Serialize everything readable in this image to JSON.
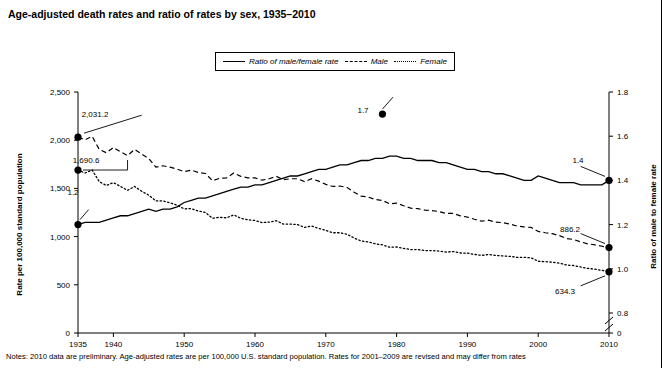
{
  "title": "Age-adjusted death rates and ratio of rates by sex, 1935–2010",
  "notes": "Notes: 2010 data are preliminary. Age-adjusted rates are per 100,000 U.S. standard population. Rates for 2001–2009 are revised and may differ from rates",
  "axis_left_label": "Rate per 100,000 standard population",
  "axis_right_label": "Ratio of male to female rate",
  "legend": {
    "items": [
      {
        "label": "Ratio of male/female rate",
        "style": "solid",
        "icon": "line-solid-icon"
      },
      {
        "label": "Male",
        "style": "dashed",
        "icon": "line-dashed-icon"
      },
      {
        "label": "Female",
        "style": "dotted",
        "icon": "line-dotted-icon"
      }
    ]
  },
  "annotations": [
    {
      "name": "male-start-label",
      "text": "2,031.2",
      "x": 95,
      "y": 117
    },
    {
      "name": "female-start-label",
      "text": "1,690.6",
      "x": 86,
      "y": 163
    },
    {
      "name": "ratio-start-label",
      "text": "1.2",
      "x": 73,
      "y": 195
    },
    {
      "name": "ratio-peak-label",
      "text": "1.7",
      "x": 363,
      "y": 113
    },
    {
      "name": "ratio-end-label",
      "text": "1.4",
      "x": 578,
      "y": 163
    },
    {
      "name": "male-end-label",
      "text": "886.2",
      "x": 570,
      "y": 232
    },
    {
      "name": "female-end-label",
      "text": "634.3",
      "x": 565,
      "y": 294
    }
  ],
  "chart_data": {
    "type": "line",
    "title": "Age-adjusted death rates and ratio of rates by sex, 1935–2010",
    "xlabel": "",
    "ylabel": "Rate per 100,000 standard population",
    "y2label": "Ratio of male to female rate",
    "grid": false,
    "legend_position": "top-center",
    "xlim": [
      1935,
      2010
    ],
    "ylim": [
      0,
      2500
    ],
    "y2lim": [
      0.8,
      1.8
    ],
    "y2_axis_break": true,
    "yticks": [
      0,
      500,
      1000,
      1500,
      2000,
      2500
    ],
    "ytick_labels": [
      "0",
      "500",
      "1,000",
      "1,500",
      "2,000",
      "2,500"
    ],
    "y2ticks": [
      0,
      0.8,
      1.0,
      1.2,
      1.4,
      1.6,
      1.8
    ],
    "y2tick_labels": [
      "0",
      "0.8",
      "1.0",
      "1.2",
      "1.4",
      "1.6",
      "1.8"
    ],
    "xticks": [
      1935,
      1940,
      1950,
      1960,
      1970,
      1980,
      1990,
      2000,
      2010
    ],
    "xtick_labels": [
      "1935",
      "1940",
      "1950",
      "1960",
      "1970",
      "1980",
      "1990",
      "2000",
      "2010"
    ],
    "annotated_points": [
      {
        "series": "Male",
        "x": 1935,
        "y": 2031.2,
        "label": "2,031.2"
      },
      {
        "series": "Female",
        "x": 1935,
        "y": 1690.6,
        "label": "1,690.6"
      },
      {
        "series": "Ratio of male/female rate",
        "x": 1935,
        "y": 1.2,
        "label": "1.2"
      },
      {
        "series": "Ratio of male/female rate",
        "x": 1978,
        "y": 1.7,
        "label": "1.7"
      },
      {
        "series": "Ratio of male/female rate",
        "x": 2010,
        "y": 1.4,
        "label": "1.4"
      },
      {
        "series": "Male",
        "x": 2010,
        "y": 886.2,
        "label": "886.2"
      },
      {
        "series": "Female",
        "x": 2010,
        "y": 634.3,
        "label": "634.3"
      }
    ],
    "x": [
      1935,
      1936,
      1937,
      1938,
      1939,
      1940,
      1941,
      1942,
      1943,
      1944,
      1945,
      1946,
      1947,
      1948,
      1949,
      1950,
      1951,
      1952,
      1953,
      1954,
      1955,
      1956,
      1957,
      1958,
      1959,
      1960,
      1961,
      1962,
      1963,
      1964,
      1965,
      1966,
      1967,
      1968,
      1969,
      1970,
      1971,
      1972,
      1973,
      1974,
      1975,
      1976,
      1977,
      1978,
      1979,
      1980,
      1981,
      1982,
      1983,
      1984,
      1985,
      1986,
      1987,
      1988,
      1989,
      1990,
      1991,
      1992,
      1993,
      1994,
      1995,
      1996,
      1997,
      1998,
      1999,
      2000,
      2001,
      2002,
      2003,
      2004,
      2005,
      2006,
      2007,
      2008,
      2009,
      2010
    ],
    "series": [
      {
        "name": "Male",
        "axis": "left",
        "style": "dashed",
        "values": [
          2031.2,
          2005.0,
          2040.0,
          1905.0,
          1870.0,
          1925.0,
          1880.0,
          1840.0,
          1905.0,
          1855.0,
          1810.0,
          1720.0,
          1735.0,
          1720.0,
          1700.0,
          1674.0,
          1690.0,
          1665.0,
          1655.0,
          1580.0,
          1605.0,
          1610.0,
          1660.0,
          1625.0,
          1610.0,
          1609.0,
          1585.0,
          1600.0,
          1625.0,
          1590.0,
          1600.0,
          1600.0,
          1570.0,
          1600.0,
          1575.0,
          1542.1,
          1520.0,
          1525.0,
          1510.0,
          1460.0,
          1420.0,
          1410.0,
          1385.0,
          1375.0,
          1340.0,
          1348.1,
          1320.0,
          1295.0,
          1290.0,
          1275.0,
          1270.0,
          1260.0,
          1240.0,
          1240.0,
          1215.0,
          1202.8,
          1180.0,
          1160.0,
          1170.0,
          1150.0,
          1145.0,
          1130.0,
          1110.0,
          1100.0,
          1095.0,
          1053.8,
          1040.0,
          1030.0,
          1010.0,
          980.0,
          970.0,
          945.0,
          925.0,
          915.0,
          900.0,
          886.2
        ]
      },
      {
        "name": "Female",
        "axis": "left",
        "style": "dotted",
        "values": [
          1690.6,
          1660.0,
          1690.0,
          1570.0,
          1530.0,
          1560.0,
          1520.0,
          1480.0,
          1520.0,
          1470.0,
          1430.0,
          1370.0,
          1370.0,
          1350.0,
          1325.0,
          1288.0,
          1290.0,
          1265.0,
          1250.0,
          1190.0,
          1200.0,
          1195.0,
          1225.0,
          1190.0,
          1175.0,
          1167.0,
          1145.0,
          1150.0,
          1165.0,
          1130.0,
          1130.0,
          1125.0,
          1095.0,
          1110.0,
          1085.0,
          1064.0,
          1040.0,
          1040.0,
          1025.0,
          985.0,
          955.0,
          945.0,
          925.0,
          915.0,
          890.0,
          892.5,
          878.0,
          865.0,
          865.0,
          855.0,
          855.0,
          850.0,
          840.0,
          845.0,
          830.0,
          827.8,
          815.0,
          805.0,
          815.0,
          805.0,
          800.0,
          795.0,
          785.0,
          785.0,
          780.0,
          744.5,
          740.0,
          735.0,
          725.0,
          705.0,
          700.0,
          685.0,
          670.0,
          662.0,
          650.0,
          634.3
        ]
      },
      {
        "name": "Ratio of male/female rate",
        "axis": "right",
        "style": "solid",
        "values": [
          1.2,
          1.21,
          1.21,
          1.21,
          1.22,
          1.23,
          1.24,
          1.24,
          1.25,
          1.26,
          1.27,
          1.26,
          1.27,
          1.27,
          1.28,
          1.3,
          1.31,
          1.32,
          1.32,
          1.33,
          1.34,
          1.35,
          1.36,
          1.37,
          1.37,
          1.38,
          1.38,
          1.39,
          1.4,
          1.41,
          1.42,
          1.42,
          1.43,
          1.44,
          1.45,
          1.45,
          1.46,
          1.47,
          1.47,
          1.48,
          1.49,
          1.49,
          1.5,
          1.5,
          1.51,
          1.51,
          1.5,
          1.5,
          1.49,
          1.49,
          1.49,
          1.48,
          1.48,
          1.47,
          1.46,
          1.45,
          1.45,
          1.44,
          1.44,
          1.43,
          1.43,
          1.42,
          1.41,
          1.4,
          1.4,
          1.42,
          1.41,
          1.4,
          1.39,
          1.39,
          1.39,
          1.38,
          1.38,
          1.38,
          1.38,
          1.4
        ]
      }
    ]
  }
}
